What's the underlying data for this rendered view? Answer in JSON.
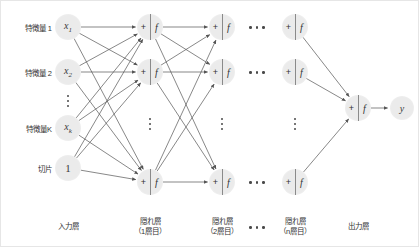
{
  "diagram": {
    "input_row_labels": [
      {
        "text": "特徴量 1",
        "y": 27
      },
      {
        "text": "特徴量 2",
        "y": 72
      },
      {
        "text": "特徴量K",
        "y": 128
      },
      {
        "text": "切片",
        "y": 168
      }
    ],
    "input_nodes": [
      {
        "label": "x",
        "sub": "1",
        "x": 68,
        "y": 27
      },
      {
        "label": "x",
        "sub": "2",
        "x": 68,
        "y": 72
      },
      {
        "label": "x",
        "sub": "k",
        "x": 68,
        "y": 128
      },
      {
        "label": "1",
        "sub": "",
        "x": 68,
        "y": 168
      }
    ],
    "unit_symbols": {
      "sum": "+",
      "activation": "f"
    },
    "hidden_columns": [
      {
        "name": "hidden-1",
        "x": 150,
        "node_ys": [
          27,
          72,
          182
        ],
        "dots_y": 128
      },
      {
        "name": "hidden-2",
        "x": 222,
        "node_ys": [
          27,
          72,
          182
        ],
        "dots_y": 128
      },
      {
        "name": "hidden-n",
        "x": 295,
        "node_ys": [
          27,
          72,
          182
        ],
        "dots_y": 128
      }
    ],
    "ellipsis_columns": [
      {
        "name": "layers-ellipsis-top",
        "x": 257,
        "y": 27
      },
      {
        "name": "layers-ellipsis-mid",
        "x": 257,
        "y": 72
      },
      {
        "name": "layers-ellipsis-bottom",
        "x": 257,
        "y": 182
      }
    ],
    "output_unit": {
      "x": 358,
      "y": 108
    },
    "output_node": {
      "label": "y",
      "x": 402,
      "y": 108
    },
    "column_labels": [
      {
        "line1": "入力層",
        "line2": "",
        "x": 68,
        "y": 222
      },
      {
        "line1": "隠れ層",
        "line2": "（1層目）",
        "x": 150,
        "y": 217
      },
      {
        "line1": "隠れ層",
        "line2": "（2層目）",
        "x": 222,
        "y": 217
      },
      {
        "line1": "隠れ層",
        "line2": "（n層目）",
        "x": 295,
        "y": 217
      },
      {
        "line1": "出力層",
        "line2": "",
        "x": 358,
        "y": 222
      }
    ],
    "bottom_ellipsis": {
      "x": 257,
      "y": 222
    },
    "colors": {
      "node_fill": "#ebebeb",
      "edge": "#555555",
      "text": "#333333",
      "border": "#e6e6e6"
    }
  }
}
